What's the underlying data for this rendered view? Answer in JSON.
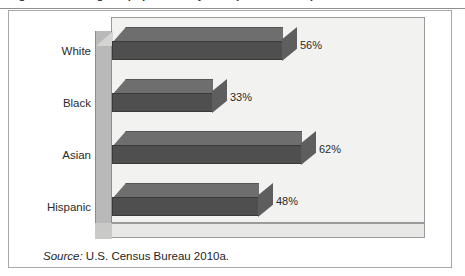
{
  "caption": {
    "text": "Figure   Percentage of population by race (2010 Census)"
  },
  "source_note": {
    "label": "Source:",
    "text": " U.S. Census Bureau 2010a."
  },
  "colors": {
    "bar_front": "#4f4f4f",
    "bar_top": "#6e6e6e",
    "bar_cap": "#5e5e5e",
    "panel": "#f2f2f0",
    "wall": "#b9b9b9",
    "border": "#a8a8a8"
  },
  "chart_data": {
    "type": "bar",
    "orientation": "horizontal",
    "title": "",
    "xlabel": "",
    "ylabel": "",
    "xlim": [
      0,
      100
    ],
    "grid": false,
    "legend": null,
    "categories": [
      "White",
      "Black",
      "Asian",
      "Hispanic"
    ],
    "values": [
      56,
      33,
      62,
      48
    ],
    "value_labels": [
      "56%",
      "33%",
      "62%",
      "48%"
    ],
    "source": "U.S. Census Bureau 2010a."
  }
}
